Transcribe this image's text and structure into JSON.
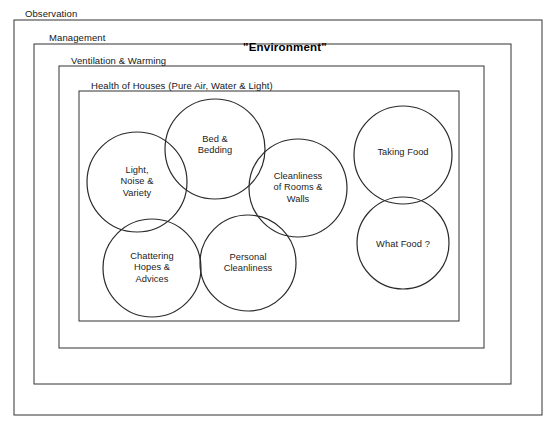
{
  "page": {
    "width": 554,
    "height": 426,
    "background_color": "#ffffff",
    "line_color": "#333333",
    "text_color": "#1a1a1a"
  },
  "cut_off_title": "Nursing",
  "env_title": {
    "label": "\"Environment\"",
    "x": 285,
    "y": 48
  },
  "layers": [
    {
      "id": "observation",
      "label": "Observation",
      "label_x": 25,
      "label_y": 8,
      "rect": {
        "x": 14,
        "y": 20,
        "w": 528,
        "h": 395
      }
    },
    {
      "id": "management",
      "label": "Management",
      "label_x": 49,
      "label_y": 32,
      "rect": {
        "x": 34,
        "y": 44,
        "w": 477,
        "h": 340
      }
    },
    {
      "id": "ventilation-warming",
      "label": "Ventilation & Warming",
      "label_x": 71,
      "label_y": 55,
      "rect": {
        "x": 59,
        "y": 66,
        "w": 425,
        "h": 282
      }
    },
    {
      "id": "health-of-houses",
      "label": "Health of Houses (Pure Air, Water & Light)",
      "label_x": 91,
      "label_y": 80,
      "rect": {
        "x": 79,
        "y": 91,
        "w": 380,
        "h": 230
      }
    }
  ],
  "circles": [
    {
      "id": "light-noise-variety",
      "label": "Light,\nNoise &\nVariety",
      "cx": 137,
      "cy": 182,
      "r": 50
    },
    {
      "id": "bed-bedding",
      "label": "Bed &\nBedding",
      "cx": 215,
      "cy": 149,
      "r": 50,
      "label_dy": -4
    },
    {
      "id": "cleanliness-rooms-walls",
      "label": "Cleanliness\nof Rooms &\nWalls",
      "cx": 298,
      "cy": 188,
      "r": 49
    },
    {
      "id": "chattering-hopes-advices",
      "label": "Chattering\nHopes &\nAdvices",
      "cx": 152,
      "cy": 268,
      "r": 49
    },
    {
      "id": "personal-cleanliness",
      "label": "Personal\nCleanliness",
      "cx": 248,
      "cy": 263,
      "r": 48
    },
    {
      "id": "taking-food",
      "label": "Taking Food",
      "cx": 403,
      "cy": 155,
      "r": 49,
      "label_dy": -2
    },
    {
      "id": "what-food",
      "label": "What Food ?",
      "cx": 403,
      "cy": 243,
      "r": 46,
      "label_dy": 2
    }
  ]
}
